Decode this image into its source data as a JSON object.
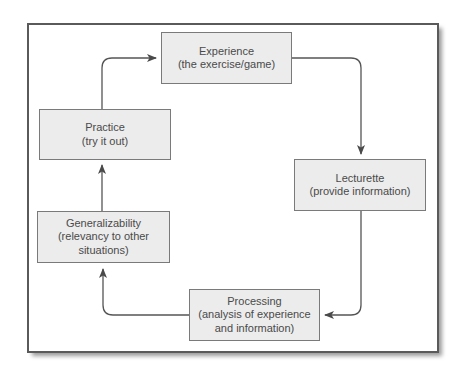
{
  "diagram": {
    "type": "cycle",
    "colors": {
      "box_fill": "#ececec",
      "box_border": "#7a7a7a",
      "text": "#4a4a4a",
      "arrow": "#555555",
      "frame": "#5a5a5a"
    },
    "nodes": [
      {
        "id": "experience",
        "title": "Experience",
        "lines": [
          "(the exercise/game)"
        ]
      },
      {
        "id": "lecturette",
        "title": "Lecturette",
        "lines": [
          "(provide information)"
        ]
      },
      {
        "id": "processing",
        "title": "Processing",
        "lines": [
          "(analysis of experience",
          "and information)"
        ]
      },
      {
        "id": "generalizability",
        "title": "Generalizability",
        "lines": [
          "(relevancy to other",
          "situations)"
        ]
      },
      {
        "id": "practice",
        "title": "Practice",
        "lines": [
          "(try it out)"
        ]
      }
    ],
    "edges": [
      {
        "from": "experience",
        "to": "lecturette"
      },
      {
        "from": "lecturette",
        "to": "processing"
      },
      {
        "from": "processing",
        "to": "generalizability"
      },
      {
        "from": "generalizability",
        "to": "practice"
      },
      {
        "from": "practice",
        "to": "experience"
      }
    ]
  }
}
